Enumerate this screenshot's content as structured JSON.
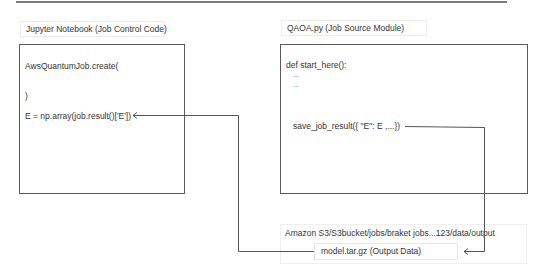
{
  "diagram": {
    "left_panel": {
      "title": "Jupyter Notebook (Job Control Code)",
      "code_lines": [
        "AwsQuantumJob.create(",
        ")",
        "E = np.array(job.result()['E'])"
      ]
    },
    "right_panel": {
      "title": "QAOA.py (Job Source Module)",
      "code_lines": [
        "def start_here():",
        "...",
        "...",
        "save_job_result({ \"E\": E ,...})"
      ]
    },
    "storage": {
      "path": "Amazon S3/S3bucket/jobs/braket jobs...123/data/output",
      "file": "model.tar.gz (Output Data)"
    },
    "connectors": [
      {
        "from": "save_job_result",
        "to": "model.tar.gz (Output Data)"
      },
      {
        "from": "model.tar.gz (Output Data)",
        "to": "E = np.array(job.result()['E'])"
      }
    ],
    "colors": {
      "box_border": "#5a5a5a",
      "connector": "#555555",
      "label_border": "#ececec"
    }
  }
}
